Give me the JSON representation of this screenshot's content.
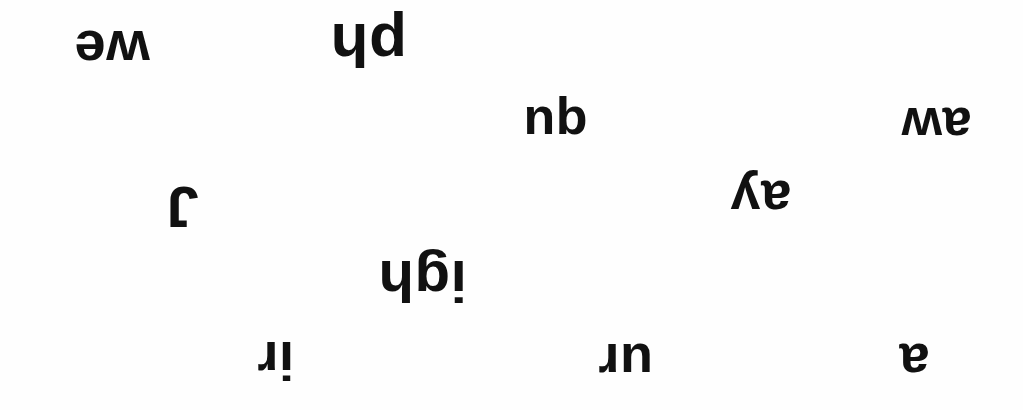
{
  "page": {
    "background_color": "#fefefe",
    "ink_color": "#111111",
    "width": 1023,
    "height": 410,
    "orientation_note": "All text is rotated 180 degrees (upside down)"
  },
  "fragments": [
    {
      "id": "frag-we",
      "text": "we",
      "left": 74,
      "top": 22,
      "font_size": 56,
      "rotation": 180
    },
    {
      "id": "frag-ph",
      "text": "ph",
      "left": 330,
      "top": 14,
      "font_size": 62,
      "rotation": 180
    },
    {
      "id": "frag-qu",
      "text": "qu",
      "left": 523,
      "top": 99,
      "font_size": 52,
      "rotation": 180
    },
    {
      "id": "frag-aw",
      "text": "aw",
      "left": 901,
      "top": 100,
      "font_size": 52,
      "rotation": 180
    },
    {
      "id": "frag-j",
      "text": "J",
      "left": 166,
      "top": 178,
      "font_size": 58,
      "rotation": 180
    },
    {
      "id": "frag-ay",
      "text": "ay",
      "left": 730,
      "top": 173,
      "font_size": 54,
      "rotation": 180
    },
    {
      "id": "frag-igh",
      "text": "igh",
      "left": 378,
      "top": 252,
      "font_size": 58,
      "rotation": 180
    },
    {
      "id": "frag-ir",
      "text": "ir",
      "left": 257,
      "top": 334,
      "font_size": 54,
      "rotation": 180
    },
    {
      "id": "frag-ur",
      "text": "ur",
      "left": 598,
      "top": 336,
      "font_size": 54,
      "rotation": 180
    },
    {
      "id": "frag-a",
      "text": "a",
      "left": 899,
      "top": 336,
      "font_size": 54,
      "rotation": 180
    }
  ]
}
